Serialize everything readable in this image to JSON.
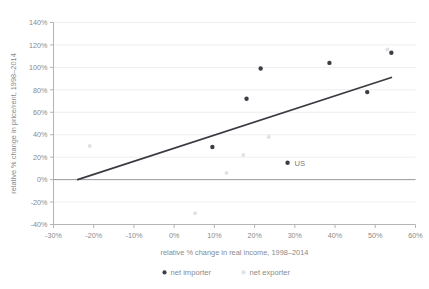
{
  "chart_data": {
    "type": "scatter",
    "title": "",
    "xlabel": "relative % change in real income, 1998–2014",
    "ylabel": "relative % change in price/rent, 1998–2014",
    "xlim": [
      -30,
      60
    ],
    "ylim": [
      -40,
      140
    ],
    "xticks": [
      "-30%",
      "-20%",
      "-10%",
      "0%",
      "10%",
      "20%",
      "30%",
      "40%",
      "50%",
      "60%"
    ],
    "xtick_values": [
      -30,
      -20,
      -10,
      0,
      10,
      20,
      30,
      40,
      50,
      60
    ],
    "yticks": [
      "-40%",
      "-20%",
      "0%",
      "20%",
      "40%",
      "60%",
      "80%",
      "100%",
      "120%",
      "140%"
    ],
    "ytick_values": [
      -40,
      -20,
      0,
      20,
      40,
      60,
      80,
      100,
      120,
      140
    ],
    "grid": "horizontal",
    "legend_position": "bottom",
    "series": [
      {
        "name": "net importer",
        "marker": "circle",
        "color": "#3d3d46",
        "points": [
          {
            "x": 9.5,
            "y": 29
          },
          {
            "x": 18.0,
            "y": 72
          },
          {
            "x": 21.5,
            "y": 99
          },
          {
            "x": 28.2,
            "y": 15,
            "label": "US"
          },
          {
            "x": 38.6,
            "y": 104
          },
          {
            "x": 48.0,
            "y": 78
          },
          {
            "x": 54.0,
            "y": 113
          }
        ]
      },
      {
        "name": "net exporter",
        "marker": "circle",
        "color": "#e2e2e6",
        "points": [
          {
            "x": -21.0,
            "y": 30
          },
          {
            "x": 5.2,
            "y": -30
          },
          {
            "x": 13.0,
            "y": 6
          },
          {
            "x": 17.2,
            "y": 22
          },
          {
            "x": 23.5,
            "y": 38
          },
          {
            "x": 53.0,
            "y": 116
          }
        ]
      }
    ],
    "trendline": {
      "name": "fit-line",
      "color": "#3a3a42",
      "x1": -24.0,
      "y1": 0,
      "x2": 54.0,
      "y2": 91
    },
    "zero_line": {
      "name": "zero-baseline",
      "color": "#9a9aa0",
      "y": 0
    },
    "legend": [
      {
        "label": "net importer",
        "color": "#3d3d46"
      },
      {
        "label": "net exporter",
        "color": "#e2e2e6"
      }
    ]
  },
  "colors": {
    "background": "#ffffff",
    "grid": "#eeeeee",
    "axis": "#b4b4b4",
    "text": "#8a8a8a",
    "importer": "#3d3d46",
    "exporter": "#e2e2e6",
    "trend": "#3a3a42"
  }
}
